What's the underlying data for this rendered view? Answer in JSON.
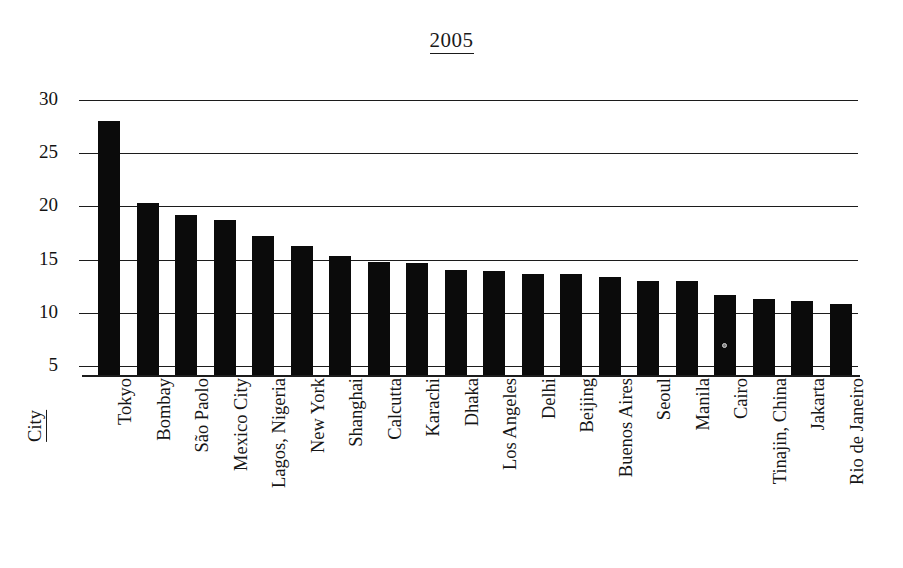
{
  "chart_data": {
    "type": "bar",
    "title": "2005",
    "xlabel": "City",
    "ylabel": "",
    "ylim": [
      5,
      30
    ],
    "yticks": [
      5,
      10,
      15,
      20,
      25,
      30
    ],
    "grid": true,
    "legend": null,
    "orientation": "vertical",
    "bar_color": "#0b0b0b",
    "categories": [
      "Tokyo",
      "Bombay",
      "São Paolo",
      "Mexico City",
      "Lagos, Nigeria",
      "New York",
      "Shanghai",
      "Calcutta",
      "Karachi",
      "Dhaka",
      "Los Angeles",
      "Delhi",
      "Beijing",
      "Buenos Aires",
      "Seoul",
      "Manila",
      "Cairo",
      "Tinajin, China",
      "Jakarta",
      "Rio de Janeiro"
    ],
    "values": [
      28.0,
      20.3,
      19.2,
      18.7,
      17.2,
      16.3,
      15.3,
      14.8,
      14.7,
      14.0,
      13.9,
      13.6,
      13.6,
      13.4,
      13.0,
      13.0,
      11.7,
      11.3,
      11.1,
      10.8
    ],
    "series": [
      {
        "name": "Population (millions)",
        "values": [
          28.0,
          20.3,
          19.2,
          18.7,
          17.2,
          16.3,
          15.3,
          14.8,
          14.7,
          14.0,
          13.9,
          13.6,
          13.6,
          13.4,
          13.0,
          13.0,
          11.7,
          11.3,
          11.1,
          10.8
        ]
      }
    ]
  },
  "title": {
    "text": "2005"
  },
  "axes": {
    "y_tick_labels": [
      "30",
      "25",
      "20",
      "15",
      "10",
      "5"
    ],
    "x_axis_title": "City"
  }
}
